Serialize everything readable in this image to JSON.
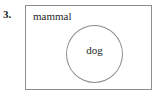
{
  "question": {
    "number": "3."
  },
  "diagram": {
    "type": "venn-subset",
    "universe": {
      "label": "mammal",
      "shape": "rectangle",
      "border_color": "#8d8d8d"
    },
    "subset": {
      "label": "dog",
      "shape": "circle",
      "border_color": "#8d8d8d"
    },
    "background_color": "#ffffff",
    "text_color": "#1f1f1f"
  }
}
